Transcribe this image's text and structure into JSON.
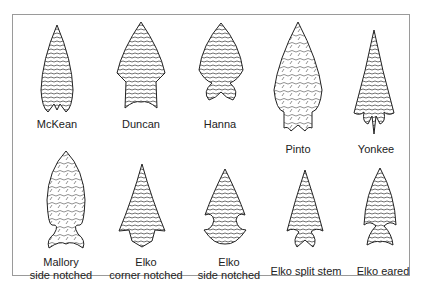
{
  "figure": {
    "points": [
      {
        "id": "mckean",
        "label": "McKean",
        "row": 1
      },
      {
        "id": "duncan",
        "label": "Duncan",
        "row": 1
      },
      {
        "id": "hanna",
        "label": "Hanna",
        "row": 1
      },
      {
        "id": "pinto",
        "label": "Pinto",
        "row": 1
      },
      {
        "id": "yonkee",
        "label": "Yonkee",
        "row": 1
      },
      {
        "id": "mallory",
        "label_line1": "Mallory",
        "label_line2": "side notched",
        "row": 2
      },
      {
        "id": "elko-corner",
        "label_line1": "Elko",
        "label_line2": "corner notched",
        "row": 2
      },
      {
        "id": "elko-side",
        "label_line1": "Elko",
        "label_line2": "side notched",
        "row": 2
      },
      {
        "id": "elko-split",
        "label": "Elko split stem",
        "row": 2
      },
      {
        "id": "elko-eared",
        "label": "Elko eared",
        "row": 2
      }
    ],
    "colors": {
      "ink": "#222222",
      "border": "#9a9a9a",
      "background": "#ffffff"
    }
  }
}
